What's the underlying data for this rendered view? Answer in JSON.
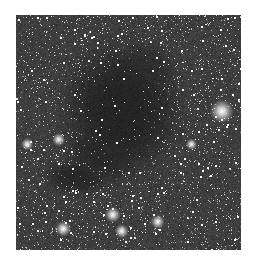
{
  "image": {
    "subject": "Dark molecular cloud silhouetted against a dense starfield",
    "palette": {
      "background_sky": "#3c3c3c",
      "nebula_core": "#1e1e1e",
      "star": "#ffffff"
    },
    "nebula": {
      "description": "Dark globule with a tail extending to the lower left",
      "lobes": [
        {
          "cx": 0.47,
          "cy": 0.4,
          "rx": 0.22,
          "ry": 0.24,
          "opacity": 0.85
        },
        {
          "cx": 0.4,
          "cy": 0.58,
          "rx": 0.16,
          "ry": 0.12,
          "opacity": 0.7
        },
        {
          "cx": 0.27,
          "cy": 0.69,
          "rx": 0.12,
          "ry": 0.06,
          "opacity": 0.75
        },
        {
          "cx": 0.55,
          "cy": 0.25,
          "rx": 0.14,
          "ry": 0.12,
          "opacity": 0.6
        }
      ]
    },
    "bright_stars": [
      {
        "x": 0.915,
        "y": 0.41,
        "size": 1.0
      },
      {
        "x": 0.21,
        "y": 0.91,
        "size": 0.55
      },
      {
        "x": 0.43,
        "y": 0.85,
        "size": 0.55
      },
      {
        "x": 0.47,
        "y": 0.92,
        "size": 0.45
      },
      {
        "x": 0.63,
        "y": 0.88,
        "size": 0.45
      },
      {
        "x": 0.19,
        "y": 0.53,
        "size": 0.4
      },
      {
        "x": 0.05,
        "y": 0.55,
        "size": 0.35
      },
      {
        "x": 0.78,
        "y": 0.55,
        "size": 0.3
      }
    ],
    "star_density": 2600,
    "seed": 68
  }
}
